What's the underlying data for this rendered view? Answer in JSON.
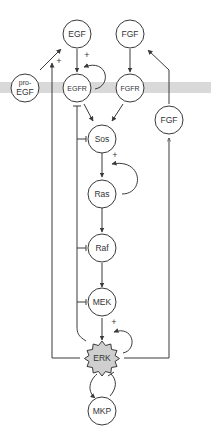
{
  "diagram": {
    "type": "signaling-pathway",
    "membrane": {
      "color": "#d9d9d9",
      "y": 82,
      "height": 11
    },
    "colors": {
      "stroke": "#3a3a3a",
      "node_fill": "#ffffff",
      "erk_fill": "#cfcfcf"
    },
    "nodes": {
      "egf": {
        "label": "EGF"
      },
      "fgf_top": {
        "label": "FGF"
      },
      "pro_egf": {
        "label_line1": "pro-",
        "label_line2": "EGF"
      },
      "egfr": {
        "label": "EGFR"
      },
      "fgfr": {
        "label": "FGFR"
      },
      "fgf_right": {
        "label": "FGF"
      },
      "sos": {
        "label": "Sos"
      },
      "ras": {
        "label": "Ras"
      },
      "raf": {
        "label": "Raf"
      },
      "mek": {
        "label": "MEK"
      },
      "erk": {
        "label": "ERK"
      },
      "mkp": {
        "label": "MKP"
      }
    },
    "signs": {
      "egfr_autoloop": "+",
      "pro_egf_to_egf": "+",
      "ras_autoloop": "+",
      "erk_autoloop": "+"
    },
    "edges": [
      {
        "from": "EGF",
        "to": "EGFR",
        "type": "activation"
      },
      {
        "from": "EGFR",
        "to": "EGFR",
        "type": "positive-feedback"
      },
      {
        "from": "FGF",
        "to": "FGFR",
        "type": "activation"
      },
      {
        "from": "pro-EGF",
        "to": "EGF",
        "type": "activation"
      },
      {
        "from": "ERK",
        "to": "pro-EGF→EGF",
        "type": "positive"
      },
      {
        "from": "EGFR",
        "to": "Sos",
        "type": "activation"
      },
      {
        "from": "FGFR",
        "to": "Sos",
        "type": "activation"
      },
      {
        "from": "Sos",
        "to": "Ras",
        "type": "activation"
      },
      {
        "from": "Ras",
        "to": "Ras",
        "type": "positive-feedback"
      },
      {
        "from": "Ras",
        "to": "Raf",
        "type": "activation"
      },
      {
        "from": "Raf",
        "to": "MEK",
        "type": "activation"
      },
      {
        "from": "MEK",
        "to": "ERK",
        "type": "activation"
      },
      {
        "from": "ERK",
        "to": "ERK",
        "type": "positive-feedback"
      },
      {
        "from": "ERK",
        "to": "EGFR/Sos/Raf/MEK",
        "type": "inhibition"
      },
      {
        "from": "ERK",
        "to": "FGF (extracellular)",
        "type": "activation"
      },
      {
        "from": "FGF (extracellular)",
        "to": "FGF",
        "type": "activation"
      },
      {
        "from": "ERK",
        "to": "MKP",
        "type": "activation"
      },
      {
        "from": "MKP",
        "to": "ERK",
        "type": "inhibition"
      }
    ]
  }
}
